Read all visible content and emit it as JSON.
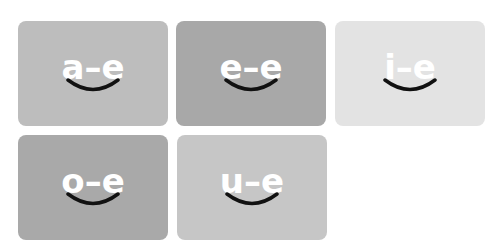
{
  "cards": [
    {
      "label": "a–e",
      "color": "#bdbdbd",
      "x": 18,
      "y": 21
    },
    {
      "label": "e–e",
      "color": "#a8a8a8",
      "x": 176,
      "y": 21
    },
    {
      "label": "i–e",
      "color": "#e3e3e3",
      "x": 335,
      "y": 21
    },
    {
      "label": "o–e",
      "color": "#a9a9a9",
      "x": 18,
      "y": 135
    },
    {
      "label": "u–e",
      "color": "#c6c6c6",
      "x": 177,
      "y": 135
    }
  ],
  "icons": {
    "smile": "smile-arc-icon"
  }
}
